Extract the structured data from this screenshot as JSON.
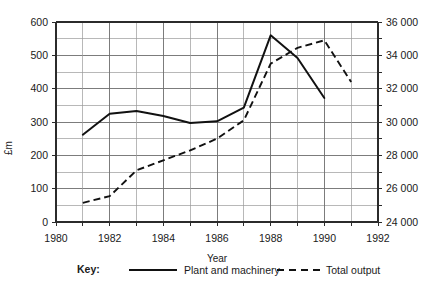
{
  "chart_data": {
    "type": "line",
    "title": "",
    "xlabel": "Year",
    "ylabel": "£m",
    "y2label": "",
    "xlim": [
      1980,
      1992
    ],
    "ylim": [
      0,
      600
    ],
    "y2lim": [
      24000,
      36000
    ],
    "grid": true,
    "legend_position": "bottom",
    "x_tick_labels": [
      "1980",
      "1982",
      "1984",
      "1986",
      "1988",
      "1990",
      "1992"
    ],
    "x_tick_values": [
      1980,
      1982,
      1984,
      1986,
      1988,
      1990,
      1992
    ],
    "x_minor_ticks": [
      1981,
      1983,
      1985,
      1987,
      1989,
      1991
    ],
    "y_tick_labels": [
      "0",
      "100",
      "200",
      "300",
      "400",
      "500",
      "600"
    ],
    "y_tick_values": [
      0,
      100,
      200,
      300,
      400,
      500,
      600
    ],
    "y_minor_step": 50,
    "y2_tick_labels": [
      "24 000",
      "26 000",
      "28 000",
      "30 000",
      "32 000",
      "34 000",
      "36 000"
    ],
    "y2_tick_values": [
      24000,
      26000,
      28000,
      30000,
      32000,
      34000,
      36000
    ],
    "y2_minor_step": 1000,
    "series": [
      {
        "name": "Plant and machinery",
        "style": "solid",
        "axis": "left",
        "x": [
          1981,
          1982,
          1983,
          1984,
          1985,
          1986,
          1987,
          1988,
          1989,
          1990
        ],
        "values": [
          262,
          325,
          333,
          318,
          297,
          302,
          343,
          560,
          492,
          372
        ]
      },
      {
        "name": "Total output",
        "style": "dashed",
        "axis": "right",
        "x": [
          1981,
          1982,
          1983,
          1984,
          1985,
          1986,
          1987,
          1988,
          1989,
          1990,
          1991
        ],
        "values": [
          25150,
          25550,
          27100,
          27700,
          28300,
          29000,
          30100,
          33500,
          34450,
          34900,
          32400
        ]
      }
    ]
  },
  "key": {
    "title": "Key:",
    "entries": [
      {
        "label": "Plant and machinery",
        "style": "solid"
      },
      {
        "label": "Total output",
        "style": "dashed"
      }
    ]
  }
}
